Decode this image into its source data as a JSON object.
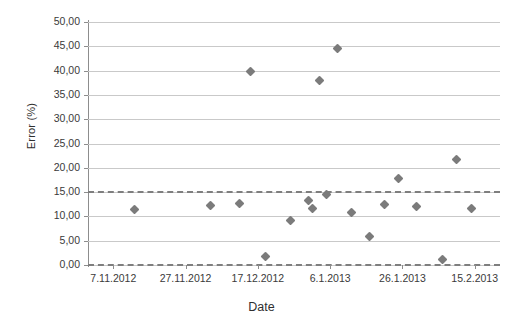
{
  "chart_data": {
    "type": "scatter",
    "title": "",
    "xlabel": "Date",
    "ylabel": "Error (%)",
    "ylim": [
      0,
      50
    ],
    "yticks": [
      0,
      5,
      10,
      15,
      20,
      25,
      30,
      35,
      40,
      45,
      50
    ],
    "ytick_labels": [
      "0,00",
      "5,00",
      "10,00",
      "15,00",
      "20,00",
      "25,00",
      "30,00",
      "35,00",
      "40,00",
      "45,00",
      "50,00"
    ],
    "xtick_labels": [
      "7.11.2012",
      "27.11.2012",
      "17.12.2012",
      "6.1.2013",
      "26.1.2013",
      "15.2.2013"
    ],
    "xtick_positions": [
      0,
      20,
      40,
      60,
      80,
      100
    ],
    "xlim": [
      -7,
      107
    ],
    "grid": true,
    "legend": false,
    "marker": "diamond",
    "marker_color": "#7b7b7b",
    "series": [
      {
        "name": "Error",
        "x": [
          6,
          27,
          35,
          38,
          42,
          49,
          54,
          55,
          57,
          59,
          62,
          66,
          71,
          75,
          79,
          84,
          91,
          95,
          99
        ],
        "values": [
          11.4,
          12.3,
          12.7,
          39.9,
          1.8,
          9.1,
          13.3,
          11.6,
          38.0,
          14.6,
          44.6,
          10.8,
          5.8,
          12.5,
          17.8,
          12.0,
          1.1,
          21.8,
          11.7
        ]
      }
    ],
    "annotations": [
      {
        "name": "upper-control-limit",
        "type": "hline",
        "value": 15.2,
        "style": "dashed",
        "color": "#7e7e7e"
      },
      {
        "name": "lower-control-limit",
        "type": "hline",
        "value": 0.3,
        "style": "dashed",
        "color": "#7e7e7e"
      }
    ]
  }
}
